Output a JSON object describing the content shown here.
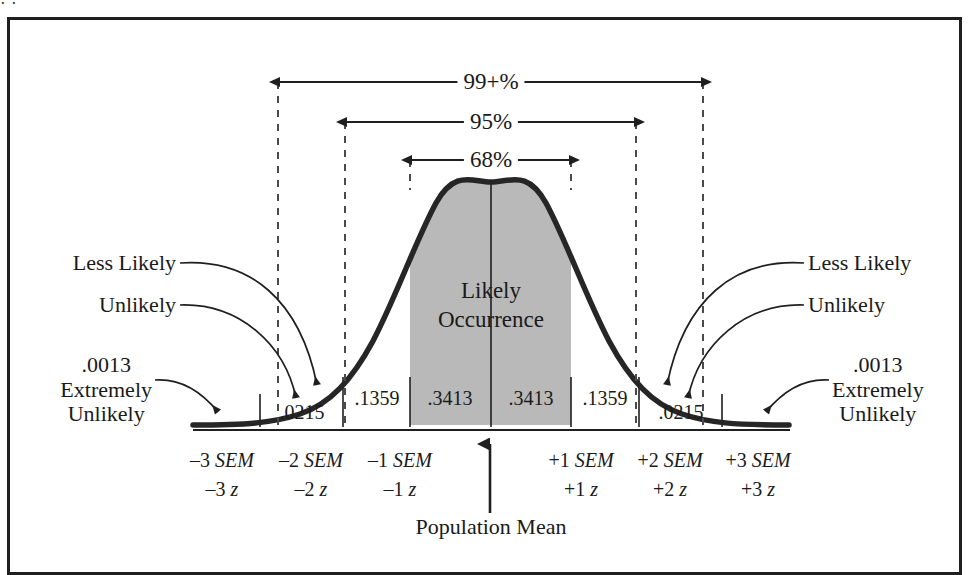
{
  "figure": {
    "frame_border_color": "#1f1f1f",
    "background": "#ffffff",
    "curve_color": "#262626",
    "shaded_fill": "#b9b9b9",
    "dash_color": "#4a4a4a",
    "top_sliver_text": "·   ·"
  },
  "brackets": {
    "outer_label": "99+%",
    "middle_label": "95%",
    "inner_label": "68%"
  },
  "area_labels": {
    "neg3_to_neg2": ".0215",
    "neg2_to_neg1": ".1359",
    "neg1_to_mean": ".3413",
    "mean_to_pos1": ".3413",
    "pos1_to_pos2": ".1359",
    "pos2_to_pos3": ".0215"
  },
  "annotations": {
    "left_less_likely": "Less Likely",
    "left_unlikely": "Unlikely",
    "left_extreme_value": ".0013",
    "left_extreme_line1": "Extremely",
    "left_extreme_line2": "Unlikely",
    "right_less_likely": "Less Likely",
    "right_unlikely": "Unlikely",
    "right_extreme_value": ".0013",
    "right_extreme_line1": "Extremely",
    "right_extreme_line2": "Unlikely",
    "center_line1": "Likely",
    "center_line2": "Occurrence",
    "mean_label": "Population Mean"
  },
  "axis": {
    "ticks": [
      {
        "sem": "–3 SEM",
        "sem_sign": "–3",
        "sem_unit": "SEM",
        "z": "–3 z",
        "z_sign": "–3",
        "z_unit": "z"
      },
      {
        "sem": "–2 SEM",
        "sem_sign": "–2",
        "sem_unit": "SEM",
        "z": "–2 z",
        "z_sign": "–2",
        "z_unit": "z"
      },
      {
        "sem": "–1 SEM",
        "sem_sign": "–1",
        "sem_unit": "SEM",
        "z": "–1 z",
        "z_sign": "–1",
        "z_unit": "z"
      },
      {
        "sem": "+1 SEM",
        "sem_sign": "+1",
        "sem_unit": "SEM",
        "z": "+1 z",
        "z_sign": "+1",
        "z_unit": "z"
      },
      {
        "sem": "+2 SEM",
        "sem_sign": "+2",
        "sem_unit": "SEM",
        "z": "+2 z",
        "z_sign": "+2",
        "z_unit": "z"
      },
      {
        "sem": "+3 SEM",
        "sem_sign": "+3",
        "sem_unit": "SEM",
        "z": "+3 z",
        "z_sign": "+3",
        "z_unit": "z"
      }
    ]
  },
  "chart_data": {
    "type": "area",
    "xlabel": "Standard error of the mean (SEM) / z score",
    "ylabel": "Relative frequency",
    "grid": false,
    "legend": "none",
    "distribution": "standard normal",
    "mean": 0,
    "sd": 1,
    "xlim": [
      -3.6,
      3.6
    ],
    "ylim": [
      0,
      1
    ],
    "x_tick_values": [
      -3,
      -2,
      -1,
      0,
      1,
      2,
      3
    ],
    "x_tick_labels": [
      "–3 SEM / –3 z",
      "–2 SEM / –2 z",
      "–1 SEM / –1 z",
      "Population Mean",
      "+1 SEM / +1 z",
      "+2 SEM / +2 z",
      "+3 SEM / +3 z"
    ],
    "band_areas": [
      {
        "interval": "–3 to –2 SEM",
        "proportion": 0.0215,
        "label": ".0215",
        "shaded": false
      },
      {
        "interval": "–2 to –1 SEM",
        "proportion": 0.1359,
        "label": ".1359",
        "shaded": false
      },
      {
        "interval": "–1 to 0 SEM",
        "proportion": 0.3413,
        "label": ".3413",
        "shaded": true
      },
      {
        "interval": "0 to +1 SEM",
        "proportion": 0.3413,
        "label": ".3413",
        "shaded": true
      },
      {
        "interval": "+1 to +2 SEM",
        "proportion": 0.1359,
        "label": ".1359",
        "shaded": false
      },
      {
        "interval": "+2 to +3 SEM",
        "proportion": 0.0215,
        "label": ".0215",
        "shaded": false
      }
    ],
    "tail_areas": [
      {
        "interval": "below –3 SEM",
        "proportion": 0.0013,
        "label": ".0013"
      },
      {
        "interval": "above +3 SEM",
        "proportion": 0.0013,
        "label": ".0013"
      }
    ],
    "coverage_brackets": [
      {
        "label": "68%",
        "from": -1,
        "to": 1,
        "proportion": 0.68
      },
      {
        "label": "95%",
        "from": -2,
        "to": 2,
        "proportion": 0.95
      },
      {
        "label": "99+%",
        "from": -3,
        "to": 3,
        "proportion": 0.9973
      }
    ],
    "annotations": [
      {
        "text": "Likely Occurrence",
        "region": "–1 to +1 SEM"
      },
      {
        "text": "Less Likely",
        "region": "–2 to –1 SEM and +1 to +2 SEM"
      },
      {
        "text": "Unlikely",
        "region": "–3 to –2 SEM and +2 to +3 SEM"
      },
      {
        "text": "Extremely Unlikely",
        "region": "beyond ±3 SEM"
      }
    ]
  }
}
